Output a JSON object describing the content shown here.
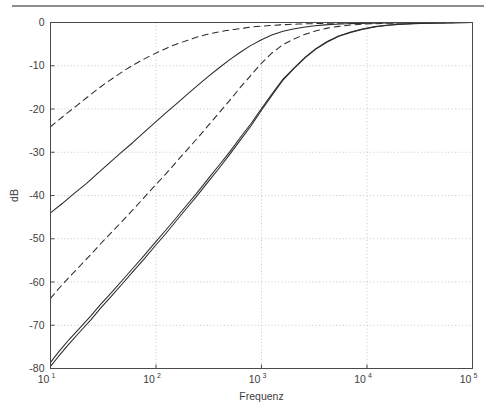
{
  "figure": {
    "top_rule": true,
    "background_color": "#ffffff"
  },
  "chart_data": {
    "type": "line",
    "title": "",
    "subtitle": "",
    "xlabel": "Frequenz",
    "ylabel": "dB",
    "xscale": "log",
    "yscale": "linear",
    "xlim": [
      10,
      100000
    ],
    "ylim": [
      -80,
      0
    ],
    "grid": true,
    "grid_style": "dotted",
    "legend": "none",
    "x_tick_labels": [
      "10",
      "10",
      "10",
      "10",
      "10"
    ],
    "x_tick_exponents": [
      "1",
      "2",
      "3",
      "4",
      "5"
    ],
    "x_tick_values": [
      10,
      100,
      1000,
      10000,
      100000
    ],
    "y_tick_labels": [
      "0",
      "-10",
      "-20",
      "-30",
      "-40",
      "-50",
      "-60",
      "-70",
      "-80"
    ],
    "y_tick_values": [
      0,
      -10,
      -20,
      -30,
      -40,
      -50,
      -60,
      -70,
      -80
    ],
    "line_color": "#2b2b2b",
    "grid_color": "#b9b9b9",
    "axis_color": "#4a4a4a",
    "series": [
      {
        "name": "first-order-dashed",
        "style": "dashed",
        "color": "#2b2b2b",
        "x": [
          10,
          12,
          15,
          18,
          22,
          27,
          33,
          40,
          50,
          60,
          75,
          90,
          110,
          135,
          165,
          200,
          250,
          300,
          370,
          450,
          550,
          680,
          820,
          1000,
          1200,
          1500,
          1800,
          2200,
          2700,
          3300,
          4000,
          5000,
          6000,
          7500,
          9000,
          11000,
          14000,
          18000,
          23000,
          30000,
          40000,
          55000,
          70000,
          100000
        ],
        "y": [
          -24.1,
          -22.5,
          -20.6,
          -19.1,
          -17.4,
          -15.7,
          -14.1,
          -12.7,
          -11.1,
          -9.9,
          -8.6,
          -7.6,
          -6.6,
          -5.6,
          -4.8,
          -4.1,
          -3.3,
          -2.8,
          -2.3,
          -1.9,
          -1.6,
          -1.3,
          -1.0,
          -0.85,
          -0.7,
          -0.55,
          -0.45,
          -0.37,
          -0.3,
          -0.24,
          -0.2,
          -0.16,
          -0.13,
          -0.1,
          -0.09,
          -0.07,
          -0.06,
          -0.04,
          -0.03,
          -0.02,
          -0.02,
          -0.01,
          -0.01,
          -0.0
        ]
      },
      {
        "name": "second-order-solid-shallow",
        "style": "solid",
        "color": "#2b2b2b",
        "x": [
          10,
          13,
          17,
          22,
          28,
          36,
          46,
          60,
          76,
          97,
          124,
          158,
          200,
          250,
          320,
          400,
          500,
          620,
          780,
          1000,
          1250,
          1600,
          2000,
          2500,
          3200,
          4000,
          5000,
          6500,
          8000,
          10000,
          13000,
          17000,
          22000,
          30000,
          40000,
          55000,
          70000,
          100000
        ],
        "y": [
          -44.0,
          -41.8,
          -39.4,
          -37.2,
          -34.9,
          -32.5,
          -30.2,
          -27.8,
          -25.5,
          -23.2,
          -20.9,
          -18.7,
          -16.5,
          -14.5,
          -12.3,
          -10.4,
          -8.6,
          -7.0,
          -5.4,
          -4.0,
          -2.9,
          -2.0,
          -1.5,
          -1.1,
          -0.75,
          -0.55,
          -0.4,
          -0.28,
          -0.2,
          -0.15,
          -0.1,
          -0.07,
          -0.05,
          -0.03,
          -0.02,
          -0.01,
          -0.01,
          -0.0
        ]
      },
      {
        "name": "third-order-dashed-steep",
        "style": "dashed",
        "color": "#2b2b2b",
        "x": [
          10,
          12,
          15,
          19,
          24,
          30,
          38,
          48,
          61,
          77,
          97,
          123,
          155,
          196,
          248,
          313,
          396,
          500,
          630,
          800,
          1000,
          1250,
          1600,
          2000,
          2600,
          3300,
          4200,
          5400,
          7000,
          9000,
          12000,
          16000,
          21000,
          28000,
          38000,
          52000,
          70000,
          100000
        ],
        "y": [
          -63.8,
          -61.5,
          -58.9,
          -56.3,
          -53.7,
          -51.1,
          -48.5,
          -45.9,
          -43.2,
          -40.5,
          -37.8,
          -35.1,
          -32.3,
          -29.5,
          -26.7,
          -23.8,
          -20.9,
          -18.0,
          -15.0,
          -12.1,
          -9.4,
          -7.1,
          -5.1,
          -3.9,
          -2.7,
          -1.9,
          -1.3,
          -0.9,
          -0.6,
          -0.4,
          -0.27,
          -0.18,
          -0.12,
          -0.08,
          -0.05,
          -0.03,
          -0.02,
          -0.0
        ]
      },
      {
        "name": "third-order-solid-steep",
        "style": "solid",
        "color": "#2b2b2b",
        "x": [
          10,
          12,
          15,
          19,
          24,
          30,
          38,
          48,
          61,
          77,
          97,
          123,
          155,
          196,
          248,
          313,
          396,
          500,
          630,
          800,
          1000,
          1250,
          1600,
          2000,
          2600,
          3300,
          4200,
          5400,
          7000,
          9000,
          12000,
          16000,
          21000,
          28000,
          38000,
          52000,
          70000,
          100000
        ],
        "y": [
          -79.5,
          -77.1,
          -74.3,
          -71.5,
          -68.8,
          -66.0,
          -63.2,
          -60.4,
          -57.5,
          -54.7,
          -51.8,
          -48.9,
          -45.9,
          -42.9,
          -39.9,
          -36.8,
          -33.7,
          -30.5,
          -27.2,
          -23.8,
          -20.3,
          -16.9,
          -13.3,
          -10.8,
          -8.1,
          -6.1,
          -4.5,
          -3.2,
          -2.3,
          -1.6,
          -1.0,
          -0.65,
          -0.42,
          -0.26,
          -0.16,
          -0.09,
          -0.05,
          -0.0
        ]
      },
      {
        "name": "second-order-solid-steep-overlay",
        "style": "solid",
        "color": "#2b2b2b",
        "x": [
          10,
          12,
          15,
          19,
          24,
          30,
          38,
          48,
          61,
          77,
          97,
          123,
          155,
          196,
          248,
          313,
          396,
          500,
          630,
          800,
          1000,
          1250,
          1600,
          2000,
          2600,
          3300,
          4200,
          5400,
          7000,
          9000,
          12000,
          16000,
          21000,
          28000,
          38000,
          52000,
          70000,
          100000
        ],
        "y": [
          -78.6,
          -76.1,
          -73.3,
          -70.6,
          -67.9,
          -65.1,
          -62.4,
          -59.6,
          -56.7,
          -53.9,
          -51.0,
          -48.1,
          -45.2,
          -42.2,
          -39.2,
          -36.1,
          -33.0,
          -29.9,
          -26.6,
          -23.3,
          -19.9,
          -16.6,
          -13.1,
          -10.7,
          -8.0,
          -6.0,
          -4.4,
          -3.1,
          -2.2,
          -1.5,
          -0.95,
          -0.6,
          -0.4,
          -0.25,
          -0.15,
          -0.09,
          -0.05,
          -0.0
        ]
      }
    ]
  }
}
